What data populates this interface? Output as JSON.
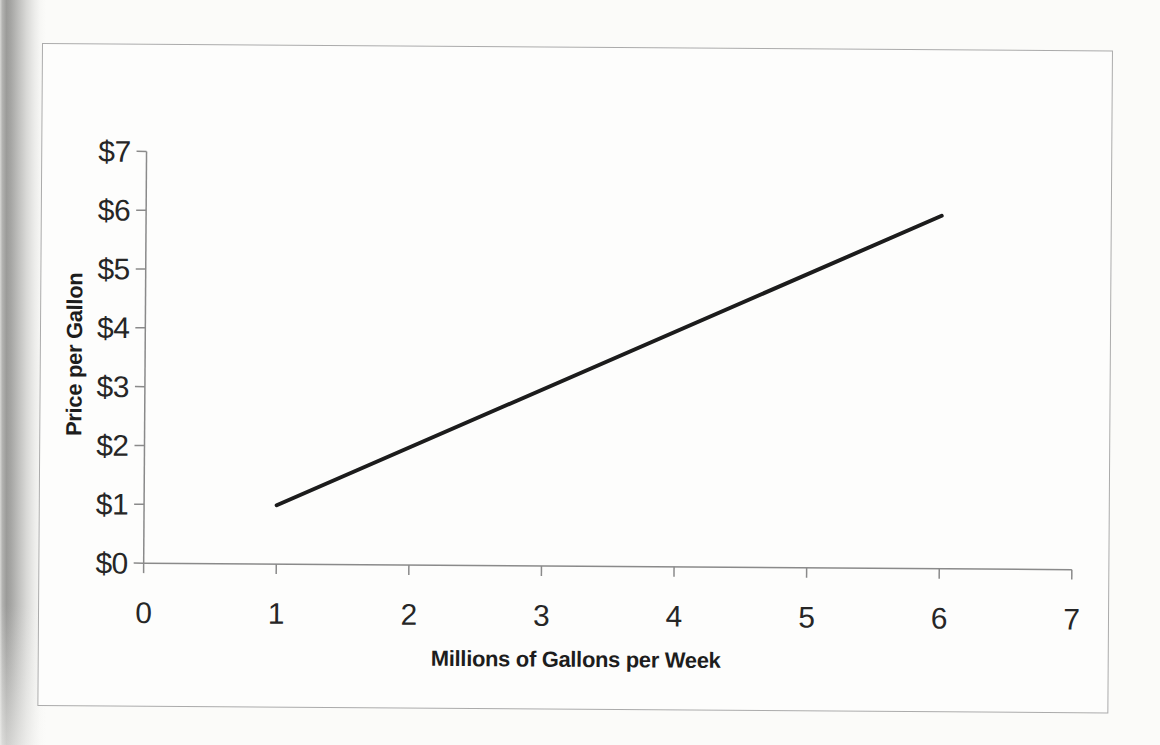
{
  "page": {
    "paper_color": "#fbfbf9",
    "scan_edge_color": "#9b9b99",
    "frame_border_color": "#ababab",
    "frame_background": "#fdfdfc"
  },
  "chart_data": {
    "type": "line",
    "title": "",
    "xlabel": "Millions of Gallons per Week",
    "ylabel": "Price per Gallon",
    "xlim": [
      0,
      7
    ],
    "ylim": [
      0,
      7
    ],
    "x_ticks": [
      "0",
      "1",
      "2",
      "3",
      "4",
      "5",
      "6",
      "7"
    ],
    "y_ticks": [
      "$0",
      "$1",
      "$2",
      "$3",
      "$4",
      "$5",
      "$6",
      "$7"
    ],
    "grid": false,
    "legend": "none",
    "axis_color": "#8a8a8a",
    "label_color": "#262626",
    "series": [
      {
        "name": "supply-line",
        "points": [
          [
            1,
            1
          ],
          [
            6,
            6
          ]
        ],
        "color": "#1c1c1c",
        "stroke_width": 4
      }
    ]
  }
}
